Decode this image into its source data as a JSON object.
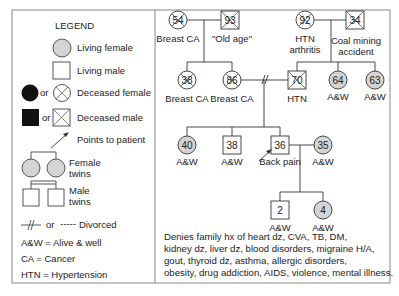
{
  "legend": {
    "title": "LEGEND",
    "items": [
      {
        "symbol": "living-female",
        "label": "Living female"
      },
      {
        "symbol": "living-male",
        "label": "Living male"
      },
      {
        "symbol": "deceased-female",
        "or": "or",
        "label": "Deceased female"
      },
      {
        "symbol": "deceased-male",
        "or": "or",
        "label": "Deceased male"
      },
      {
        "symbol": "arrow",
        "label": "Points to patient"
      },
      {
        "symbol": "female-twins",
        "label_line1": "Female",
        "label_line2": "twins"
      },
      {
        "symbol": "male-twins",
        "label_line1": "Male",
        "label_line2": "twins"
      },
      {
        "symbol": "divorced",
        "or": "or",
        "dashes": "-----",
        "label": "Divorced"
      }
    ],
    "abbreviations": [
      "A&W = Alive & well",
      "CA = Cancer",
      "HTN = Hypertension"
    ]
  },
  "pedigree": {
    "gen1": {
      "maternal_grandmother": {
        "age": "54",
        "sex": "female",
        "deceased": true,
        "label": "Breast CA"
      },
      "maternal_grandfather": {
        "age": "93",
        "sex": "male",
        "deceased": true,
        "label": "\"Old age\""
      },
      "paternal_grandmother": {
        "age": "92",
        "sex": "female",
        "deceased": true,
        "label_line1": "HTN",
        "label_line2": "arthritis"
      },
      "paternal_grandfather": {
        "age": "34",
        "sex": "male",
        "deceased": true,
        "label_line1": "Coal mining",
        "label_line2": "accident"
      }
    },
    "gen2": {
      "aunt": {
        "age": "38",
        "sex": "female",
        "deceased": true,
        "label": "Breast CA"
      },
      "mother": {
        "age": "86",
        "sex": "female",
        "deceased": true,
        "label": "Breast CA"
      },
      "father": {
        "age": "70",
        "sex": "male",
        "deceased": true,
        "label": "HTN"
      },
      "paternal_aunt_1": {
        "age": "64",
        "sex": "female",
        "deceased": false,
        "label": "A&W"
      },
      "paternal_aunt_2": {
        "age": "63",
        "sex": "female",
        "deceased": false,
        "label": "A&W"
      }
    },
    "gen3": {
      "sister": {
        "age": "40",
        "sex": "female",
        "deceased": false,
        "label": "A&W"
      },
      "brother": {
        "age": "38",
        "sex": "male",
        "deceased": false,
        "label": "A&W"
      },
      "patient": {
        "age": "36",
        "sex": "male",
        "deceased": false,
        "label": "Back pain"
      },
      "spouse": {
        "age": "35",
        "sex": "female",
        "deceased": false,
        "label": "A&W"
      }
    },
    "gen4": {
      "son": {
        "age": "2",
        "sex": "male",
        "deceased": false,
        "label": "A&W"
      },
      "daughter": {
        "age": "4",
        "sex": "female",
        "deceased": false,
        "label": "A&W"
      }
    }
  },
  "notes": [
    "Denies family hx of heart dz, CVA, TB, DM,",
    "kidney dz, liver dz,  blood disorders, migraine H/A,",
    "gout, thyroid dz, asthma, allergic disorders,",
    "obesity, drug addiction, AIDS, violence, mental illness."
  ],
  "colors": {
    "female_fill": "#d4d4d4",
    "line": "#333333",
    "border": "#777777"
  }
}
